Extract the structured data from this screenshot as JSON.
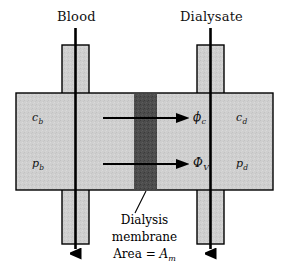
{
  "figure": {
    "title_left": "Blood",
    "title_right": "Dialysate",
    "background_color": "#ffffff",
    "chamber_fill": "#cfcfcf",
    "membrane_fill": "#4a4a4a",
    "stroke_color": "#000000"
  },
  "labels": {
    "blood_concentration": "c",
    "blood_concentration_sub": "b",
    "blood_pressure": "p",
    "blood_pressure_sub": "b",
    "dialysate_concentration": "c",
    "dialysate_concentration_sub": "d",
    "dialysate_pressure": "p",
    "dialysate_pressure_sub": "d",
    "solute_flux": "ϕ",
    "solute_flux_sub": "c",
    "volume_flux": "Φ",
    "volume_flux_sub": "V"
  },
  "caption": {
    "line1": "Dialysis",
    "line2": "membrane",
    "line3_prefix": "Area = ",
    "line3_symbol": "A",
    "line3_sub": "m"
  },
  "icons": {
    "blood_flow_arrow": "down-arrow-icon",
    "dialysate_flow_arrow": "down-arrow-icon",
    "solute_flux_arrow": "right-arrow-icon",
    "volume_flux_arrow": "right-arrow-icon",
    "caption_leader": "leader-line-icon"
  }
}
